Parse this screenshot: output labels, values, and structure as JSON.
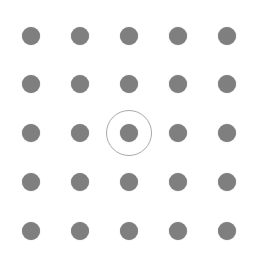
{
  "pattern_lock": {
    "rows": 5,
    "cols": 5,
    "dot_color": "#7f7f7f",
    "ring_color": "#a8a8a8",
    "col_x": [
      31,
      80,
      129,
      178,
      227
    ],
    "row_y": [
      36,
      84,
      133,
      182,
      231
    ],
    "selected": {
      "row": 2,
      "col": 2
    }
  }
}
